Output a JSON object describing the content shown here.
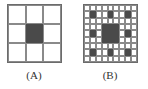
{
  "figure": {
    "panels": [
      {
        "id": "A",
        "label": "(A)",
        "grid_size": 3,
        "filled_cells": [
          [
            1,
            1
          ]
        ]
      },
      {
        "id": "B",
        "label": "(B)",
        "grid_size": 9,
        "filled_cells": [
          [
            1,
            1
          ],
          [
            1,
            4
          ],
          [
            1,
            7
          ],
          [
            4,
            1
          ],
          [
            4,
            7
          ],
          [
            7,
            1
          ],
          [
            7,
            4
          ],
          [
            7,
            7
          ],
          [
            3,
            3
          ],
          [
            3,
            4
          ],
          [
            3,
            5
          ],
          [
            4,
            3
          ],
          [
            4,
            4
          ],
          [
            4,
            5
          ],
          [
            5,
            3
          ],
          [
            5,
            4
          ],
          [
            5,
            5
          ]
        ]
      }
    ],
    "colors": {
      "fill": "#4a4a4a",
      "grid_line": "#8a8a8a",
      "background": "#ffffff"
    }
  }
}
